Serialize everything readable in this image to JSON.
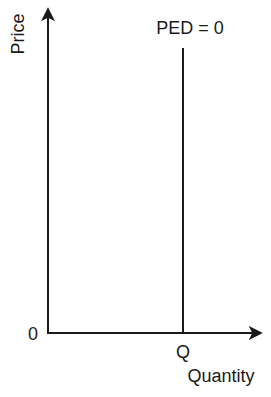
{
  "diagram": {
    "y_axis": {
      "label": "Price"
    },
    "x_axis": {
      "label": "Quantity"
    },
    "origin_label": "0",
    "curve_annotation": "PED = 0",
    "quantity_marker": "Q",
    "colors": {
      "line": "#1a1a1a",
      "background": "#ffffff"
    }
  }
}
